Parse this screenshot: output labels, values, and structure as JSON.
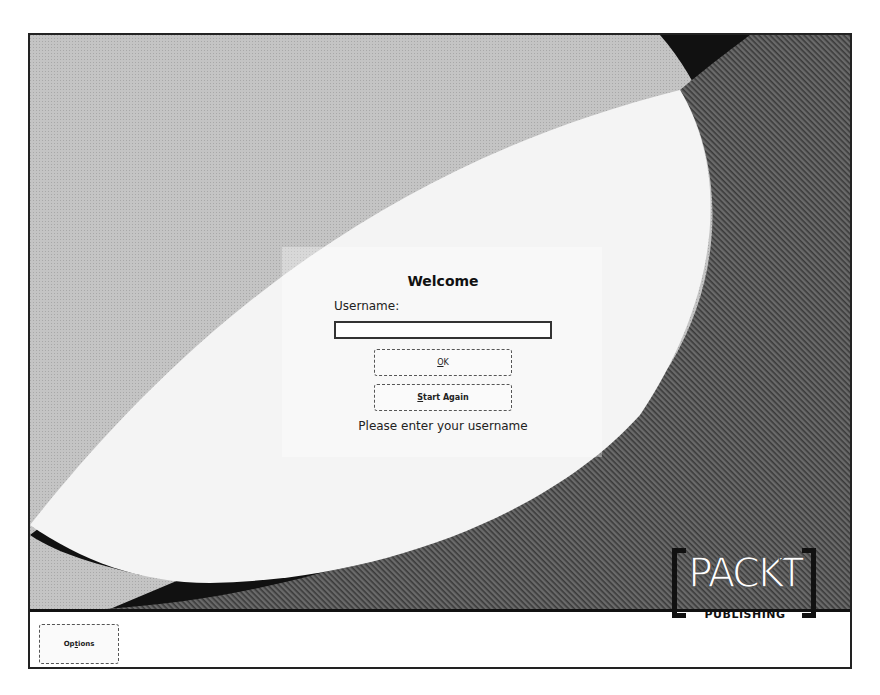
{
  "dialog": {
    "title": "Welcome",
    "username_label": "Username:",
    "username_value": "",
    "ok_label_accel": "O",
    "ok_label_rest": "K",
    "start_again_accel": "S",
    "start_again_rest": "tart Again",
    "status_text": "Please enter your username"
  },
  "footer": {
    "options_accel_pre": "Op",
    "options_accel": "t",
    "options_rest": "ions"
  },
  "logo": {
    "brand": "PACKT",
    "tagline": "PUBLISHING"
  },
  "colors": {
    "light_region": "#bdbdbd",
    "dark_region": "#5a5a5a",
    "ellipse": "#f4f4f4",
    "corner": "#111111"
  }
}
